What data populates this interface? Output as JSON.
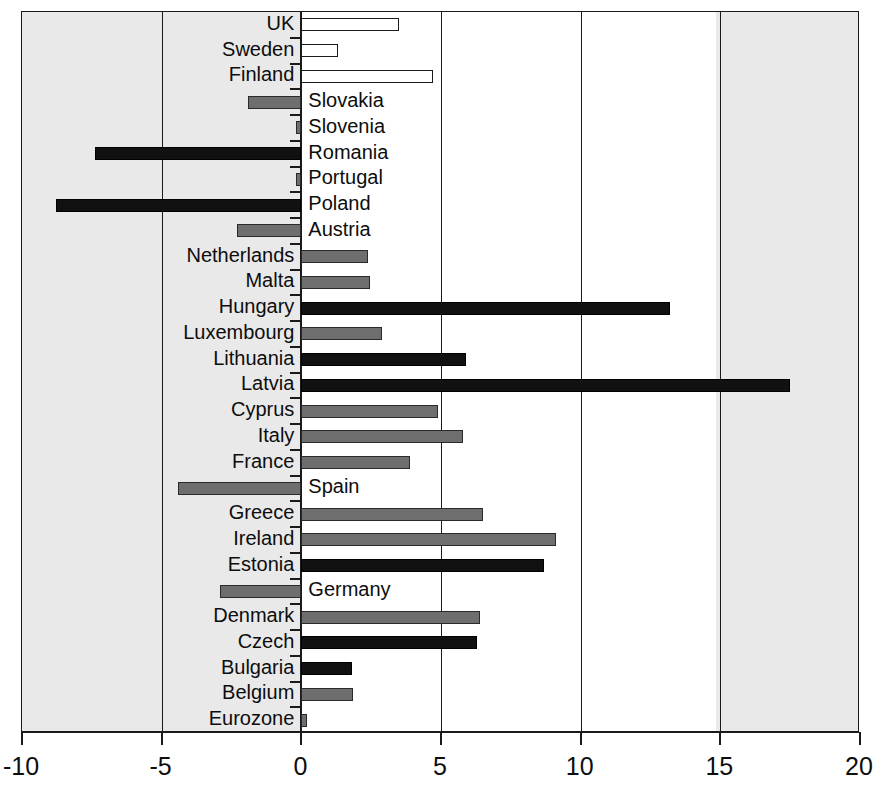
{
  "chart_data": {
    "type": "bar",
    "orientation": "horizontal",
    "title": "",
    "subtitle": "",
    "xlabel": "",
    "ylabel": "",
    "xlim": [
      -10,
      20
    ],
    "xticks": [
      -10,
      -5,
      0,
      5,
      10,
      15,
      20
    ],
    "xtick_labels": [
      "-10",
      "-5",
      "0",
      "5",
      "10",
      "15",
      "20"
    ],
    "grid": true,
    "gridlines_at": [
      -5,
      0,
      5,
      10,
      15
    ],
    "legend": [],
    "categories": [
      "UK",
      "Sweden",
      "Finland",
      "Slovakia",
      "Slovenia",
      "Romania",
      "Portugal",
      "Poland",
      "Austria",
      "Netherlands",
      "Malta",
      "Hungary",
      "Luxembourg",
      "Lithuania",
      "Latvia",
      "Cyprus",
      "Italy",
      "France",
      "Spain",
      "Greece",
      "Ireland",
      "Estonia",
      "Germany",
      "Denmark",
      "Czech",
      "Bulgaria",
      "Belgium",
      "Eurozone"
    ],
    "values": [
      3.5,
      1.3,
      4.7,
      -1.9,
      -0.2,
      -7.4,
      -0.2,
      -8.8,
      -2.3,
      2.4,
      2.45,
      13.2,
      2.9,
      5.9,
      17.5,
      4.9,
      5.8,
      3.9,
      -4.4,
      6.5,
      9.1,
      8.7,
      -2.9,
      6.4,
      6.3,
      1.8,
      1.85,
      0.2
    ],
    "bar_styles": [
      "white",
      "white",
      "white",
      "grey",
      "grey",
      "black",
      "grey",
      "black",
      "grey",
      "grey",
      "grey",
      "black",
      "grey",
      "black",
      "black",
      "grey",
      "grey",
      "grey",
      "grey",
      "grey",
      "grey",
      "black",
      "grey",
      "grey",
      "black",
      "black",
      "grey",
      "grey"
    ],
    "colors": {
      "white_bar": "#ffffff",
      "grey_bar": "#6e6e6e",
      "black_bar": "#111111",
      "axis": "#1a1a1a",
      "background": "#ffffff",
      "page_tint": "#e9e9e9"
    }
  }
}
